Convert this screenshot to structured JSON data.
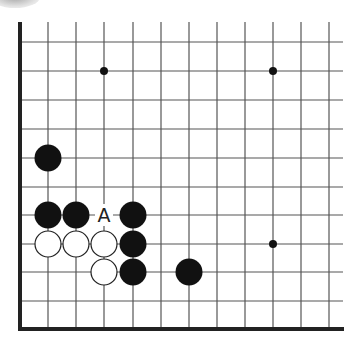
{
  "diagram": {
    "type": "go-board-fragment",
    "grid": {
      "x_lines": [
        48,
        76,
        104,
        133,
        161,
        189,
        217,
        245,
        273,
        301,
        329
      ],
      "y_lines": [
        42,
        71,
        100,
        129,
        158,
        187,
        215,
        244,
        272,
        301
      ],
      "left_edge_x": 20,
      "bottom_edge_y": 329,
      "top_y": 22,
      "right_x": 343,
      "line_color": "#555555",
      "edge_color": "#222222"
    },
    "star_points": [
      {
        "x": 104,
        "y": 71
      },
      {
        "x": 273,
        "y": 71
      },
      {
        "x": 273,
        "y": 244
      }
    ],
    "stones": [
      {
        "color": "black",
        "x": 48,
        "y": 158
      },
      {
        "color": "black",
        "x": 48,
        "y": 215
      },
      {
        "color": "black",
        "x": 76,
        "y": 215
      },
      {
        "color": "black",
        "x": 133,
        "y": 215
      },
      {
        "color": "white",
        "x": 48,
        "y": 244
      },
      {
        "color": "white",
        "x": 76,
        "y": 244
      },
      {
        "color": "white",
        "x": 104,
        "y": 244
      },
      {
        "color": "black",
        "x": 133,
        "y": 244
      },
      {
        "color": "white",
        "x": 104,
        "y": 272
      },
      {
        "color": "black",
        "x": 133,
        "y": 272
      },
      {
        "color": "black",
        "x": 189,
        "y": 272
      }
    ],
    "labels": [
      {
        "text": "A",
        "x": 104,
        "y": 215
      }
    ],
    "stone_radius": 13.5,
    "colors": {
      "black_stone": "#111111",
      "white_stone": "#ffffff",
      "white_stroke": "#222222"
    }
  }
}
